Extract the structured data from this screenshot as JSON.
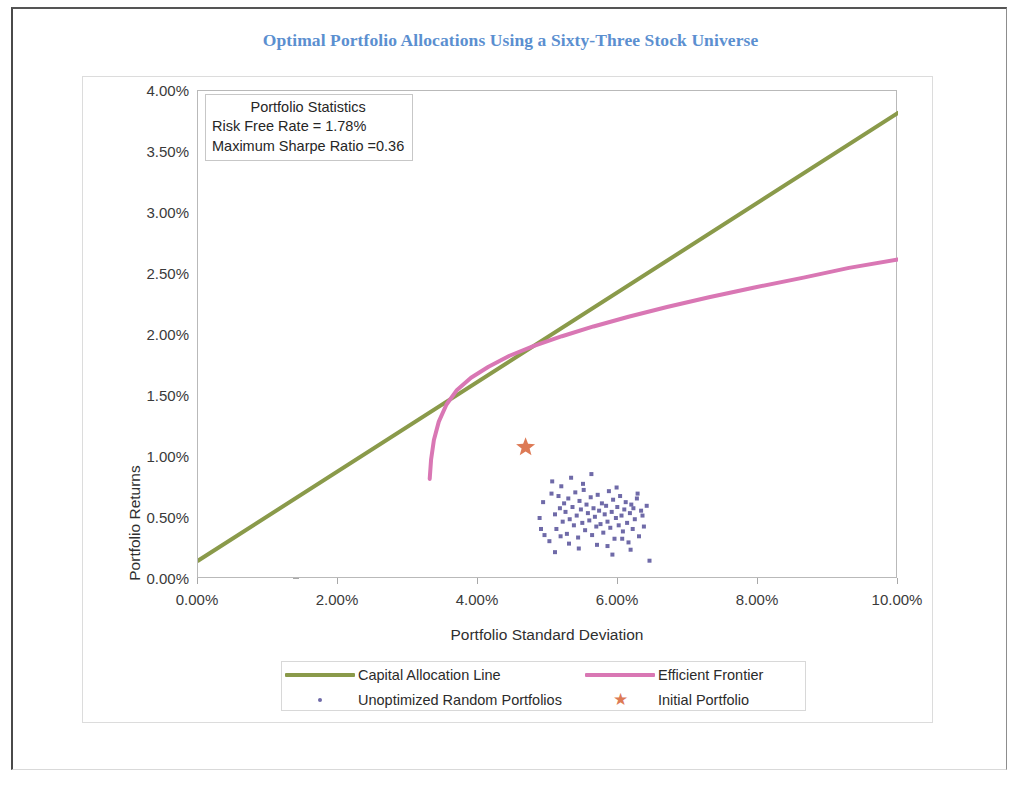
{
  "title": "Optimal Portfolio Allocations Using a Sixty-Three Stock Universe",
  "annotation": {
    "heading": "Portfolio Statistics",
    "line1": "Risk Free Rate = 1.78%",
    "line2": "Maximum Sharpe Ratio =0.36"
  },
  "colors": {
    "title": "#5b8fd0",
    "capital_allocation_line": "#8a9a4a",
    "efficient_frontier": "#d977b4",
    "random_portfolios": "#6f6aa8",
    "initial_portfolio": "#dd7a55",
    "axis": "#b9b9b9",
    "text": "#2f2f2f"
  },
  "chart_data": {
    "type": "line",
    "title": "Optimal Portfolio Allocations Using a Sixty-Three Stock Universe",
    "xlabel": "Portfolio Standard Deviation",
    "ylabel": "Portfolio Returns",
    "xlim": [
      0.0,
      10.0
    ],
    "ylim": [
      0.0,
      4.0
    ],
    "xticks": [
      "0.00%",
      "2.00%",
      "4.00%",
      "6.00%",
      "8.00%",
      "10.00%"
    ],
    "xtick_values": [
      0.0,
      2.0,
      4.0,
      6.0,
      8.0,
      10.0
    ],
    "yticks": [
      "0.00%",
      "0.50%",
      "1.00%",
      "1.50%",
      "2.00%",
      "2.50%",
      "3.00%",
      "3.50%",
      "4.00%"
    ],
    "ytick_values": [
      0.0,
      0.5,
      1.0,
      1.5,
      2.0,
      2.5,
      3.0,
      3.5,
      4.0
    ],
    "grid": false,
    "legend_position": "bottom",
    "units": "percent",
    "annotations": [
      {
        "text": "Portfolio Statistics",
        "x": 0.55,
        "y": 3.87
      },
      {
        "text": "Risk Free Rate = 1.78%",
        "x": 0.2,
        "y": 3.69
      },
      {
        "text": "Maximum Sharpe Ratio =0.36",
        "x": 0.2,
        "y": 3.51
      }
    ],
    "series": [
      {
        "name": "Capital Allocation Line",
        "type": "line",
        "color": "#8a9a4a",
        "x": [
          0.0,
          10.0
        ],
        "y": [
          0.15,
          3.82
        ]
      },
      {
        "name": "Efficient Frontier",
        "type": "line",
        "color": "#d977b4",
        "x": [
          3.31,
          3.33,
          3.37,
          3.44,
          3.55,
          3.7,
          3.9,
          4.15,
          4.45,
          4.8,
          5.2,
          5.65,
          6.15,
          6.7,
          7.3,
          7.95,
          8.65,
          9.3,
          10.0
        ],
        "y": [
          0.82,
          0.98,
          1.14,
          1.29,
          1.43,
          1.55,
          1.65,
          1.74,
          1.83,
          1.91,
          1.99,
          2.07,
          2.15,
          2.23,
          2.31,
          2.39,
          2.47,
          2.55,
          2.62
        ]
      },
      {
        "name": "Unoptimized Random Portfolios",
        "type": "scatter",
        "color": "#6f6aa8",
        "points": [
          [
            4.88,
            0.5
          ],
          [
            4.93,
            0.63
          ],
          [
            5.02,
            0.31
          ],
          [
            5.05,
            0.7
          ],
          [
            5.1,
            0.53
          ],
          [
            5.12,
            0.41
          ],
          [
            5.15,
            0.68
          ],
          [
            5.17,
            0.58
          ],
          [
            5.19,
            0.76
          ],
          [
            5.21,
            0.47
          ],
          [
            5.23,
            0.62
          ],
          [
            5.25,
            0.55
          ],
          [
            5.27,
            0.37
          ],
          [
            5.29,
            0.66
          ],
          [
            5.31,
            0.49
          ],
          [
            5.33,
            0.83
          ],
          [
            5.35,
            0.59
          ],
          [
            5.37,
            0.44
          ],
          [
            5.39,
            0.71
          ],
          [
            5.41,
            0.52
          ],
          [
            5.43,
            0.34
          ],
          [
            5.45,
            0.64
          ],
          [
            5.47,
            0.57
          ],
          [
            5.49,
            0.46
          ],
          [
            5.51,
            0.73
          ],
          [
            5.53,
            0.4
          ],
          [
            5.55,
            0.61
          ],
          [
            5.57,
            0.54
          ],
          [
            5.59,
            0.48
          ],
          [
            5.61,
            0.67
          ],
          [
            5.63,
            0.36
          ],
          [
            5.65,
            0.58
          ],
          [
            5.67,
            0.51
          ],
          [
            5.69,
            0.43
          ],
          [
            5.71,
            0.69
          ],
          [
            5.73,
            0.56
          ],
          [
            5.75,
            0.45
          ],
          [
            5.77,
            0.62
          ],
          [
            5.79,
            0.38
          ],
          [
            5.81,
            0.53
          ],
          [
            5.83,
            0.6
          ],
          [
            5.85,
            0.47
          ],
          [
            5.87,
            0.72
          ],
          [
            5.89,
            0.42
          ],
          [
            5.91,
            0.55
          ],
          [
            5.93,
            0.65
          ],
          [
            5.95,
            0.33
          ],
          [
            5.97,
            0.5
          ],
          [
            5.99,
            0.59
          ],
          [
            6.01,
            0.44
          ],
          [
            6.03,
            0.68
          ],
          [
            6.05,
            0.52
          ],
          [
            6.07,
            0.39
          ],
          [
            6.09,
            0.57
          ],
          [
            6.11,
            0.63
          ],
          [
            6.13,
            0.46
          ],
          [
            6.15,
            0.3
          ],
          [
            6.17,
            0.54
          ],
          [
            6.19,
            0.61
          ],
          [
            6.21,
            0.41
          ],
          [
            6.24,
            0.49
          ],
          [
            6.27,
            0.66
          ],
          [
            6.3,
            0.35
          ],
          [
            6.33,
            0.56
          ],
          [
            6.37,
            0.43
          ],
          [
            6.41,
            0.6
          ],
          [
            6.45,
            0.15
          ],
          [
            5.1,
            0.22
          ],
          [
            5.44,
            0.25
          ],
          [
            5.7,
            0.28
          ],
          [
            5.92,
            0.2
          ],
          [
            6.18,
            0.24
          ],
          [
            4.95,
            0.36
          ],
          [
            5.06,
            0.8
          ],
          [
            5.62,
            0.86
          ],
          [
            6.28,
            0.7
          ],
          [
            6.35,
            0.52
          ],
          [
            4.9,
            0.41
          ],
          [
            5.3,
            0.29
          ],
          [
            5.85,
            0.27
          ],
          [
            6.06,
            0.33
          ],
          [
            5.18,
            0.35
          ],
          [
            5.5,
            0.78
          ],
          [
            5.98,
            0.75
          ],
          [
            6.22,
            0.58
          ]
        ]
      },
      {
        "name": "Initial Portfolio",
        "type": "scatter",
        "marker": "star",
        "color": "#dd7a55",
        "points": [
          [
            4.68,
            1.08
          ]
        ]
      }
    ]
  },
  "legend": {
    "items": [
      {
        "label": "Capital Allocation Line",
        "key": "line",
        "color": "#8a9a4a"
      },
      {
        "label": "Efficient Frontier",
        "key": "line",
        "color": "#d977b4"
      },
      {
        "label": "Unoptimized Random Portfolios",
        "key": "dot",
        "color": "#6f6aa8"
      },
      {
        "label": "Initial Portfolio",
        "key": "star",
        "color": "#dd7a55"
      }
    ]
  }
}
